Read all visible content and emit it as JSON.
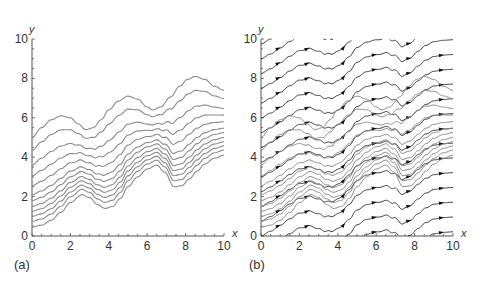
{
  "chart_data": [
    {
      "panel": "(a)",
      "type": "line",
      "title": "",
      "xlabel": "x",
      "ylabel": "y",
      "xlim": [
        0,
        10
      ],
      "ylim": [
        0,
        10
      ],
      "xticks": [
        0,
        2,
        4,
        6,
        8,
        10
      ],
      "yticks": [
        0,
        2,
        4,
        6,
        8,
        10
      ],
      "grid": false,
      "legend": null,
      "line_color": "#8a8a8a",
      "profile_low": {
        "x": [
          0,
          0.5,
          1,
          1.5,
          2,
          2.6,
          3,
          3.4,
          3.8,
          4.2,
          4.6,
          5,
          5.5,
          6,
          6.5,
          6.9,
          7.4,
          7.8,
          8.2,
          8.6,
          9,
          9.5,
          10
        ],
        "y": [
          0.45,
          0.55,
          0.8,
          1.2,
          1.7,
          2.1,
          1.95,
          1.6,
          1.4,
          1.5,
          1.9,
          2.5,
          3.0,
          3.4,
          3.6,
          3.25,
          2.5,
          2.55,
          2.9,
          3.3,
          3.65,
          3.95,
          4.1
        ]
      },
      "profile_high": {
        "x": [
          0,
          0.5,
          1,
          1.5,
          2,
          2.4,
          2.8,
          3.2,
          3.6,
          4,
          4.5,
          5,
          5.5,
          6,
          6.3,
          6.7,
          7.2,
          7.7,
          8.1,
          8.5,
          9,
          9.5,
          10
        ],
        "y": [
          5.0,
          5.5,
          5.9,
          6.1,
          6.0,
          5.7,
          5.4,
          5.5,
          5.9,
          6.4,
          6.85,
          7.1,
          6.95,
          6.55,
          6.4,
          6.55,
          7.05,
          7.6,
          7.95,
          8.1,
          7.95,
          7.6,
          7.4
        ]
      },
      "series": [
        {
          "name": "curve-1",
          "y0": 0.45,
          "blend": 0.0
        },
        {
          "name": "curve-2",
          "y0": 0.75,
          "blend": 0.03
        },
        {
          "name": "curve-3",
          "y0": 1.0,
          "blend": 0.06
        },
        {
          "name": "curve-4",
          "y0": 1.25,
          "blend": 0.09
        },
        {
          "name": "curve-5",
          "y0": 1.5,
          "blend": 0.12
        },
        {
          "name": "curve-6",
          "y0": 1.8,
          "blend": 0.16
        },
        {
          "name": "curve-7",
          "y0": 2.1,
          "blend": 0.22
        },
        {
          "name": "curve-8",
          "y0": 2.55,
          "blend": 0.32
        },
        {
          "name": "curve-9",
          "y0": 3.05,
          "blend": 0.45
        },
        {
          "name": "curve-10",
          "y0": 3.6,
          "blend": 0.62
        },
        {
          "name": "curve-11",
          "y0": 4.35,
          "blend": 0.82
        },
        {
          "name": "curve-12",
          "y0": 5.0,
          "blend": 1.0
        }
      ]
    },
    {
      "panel": "(b)",
      "type": "line",
      "subtype": "direction field streamlines",
      "title": "",
      "xlabel": "x",
      "ylabel": "y",
      "xlim": [
        0,
        10
      ],
      "ylim": [
        0,
        10
      ],
      "xticks": [
        0,
        2,
        4,
        6,
        8,
        10
      ],
      "yticks": [
        0,
        2,
        4,
        6,
        8,
        10
      ],
      "grid": false,
      "legend": null,
      "streamline_color": "#2a2a2a",
      "solution_color": "#8a8a8a",
      "arrow_color": "#111111",
      "streamline_offsets": [
        -6,
        -5.25,
        -4.5,
        -3.75,
        -3.0,
        -2.25,
        -1.5,
        -0.75,
        0,
        0.75,
        1.5,
        2.25,
        3.0,
        3.75,
        4.5,
        5.25,
        6.0,
        6.75,
        7.5,
        8.25,
        9.0,
        9.75,
        10.5,
        11.25
      ],
      "arrow_x_positions": [
        0.9,
        2.4,
        4.3,
        5.9,
        7.7,
        9.4
      ],
      "overlay_solution_curves": true
    }
  ],
  "labels": {
    "panel_a": "(a)",
    "panel_b": "(b)",
    "x_axis": "x",
    "y_axis": "y"
  }
}
